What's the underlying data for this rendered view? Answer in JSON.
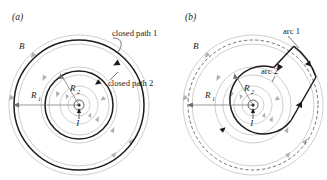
{
  "figure": {
    "background_color": "#ffffff",
    "ink_color": "#1c1c1c",
    "fieldline_color": "#b9b9b9",
    "dashed_color": "#4a4a4a"
  },
  "panels": [
    {
      "id": "a",
      "label": "(a)",
      "field_label": "B",
      "current_label": "I",
      "radius_outer_label": "R",
      "radius_outer_sub": "1",
      "radius_inner_label": "R",
      "radius_inner_sub": "2",
      "annotations": [
        {
          "name": "closed-path-1",
          "text": "closed path 1"
        },
        {
          "name": "closed-path-2",
          "text": "closed path 2"
        }
      ]
    },
    {
      "id": "b",
      "label": "(b)",
      "field_label": "B",
      "current_label": "I",
      "radius_outer_label": "R",
      "radius_outer_sub": "1",
      "radius_inner_label": "R",
      "radius_inner_sub": "2",
      "annotations": [
        {
          "name": "arc-1",
          "text": "arc 1"
        },
        {
          "name": "arc-2",
          "text": "arc 2"
        }
      ]
    }
  ]
}
